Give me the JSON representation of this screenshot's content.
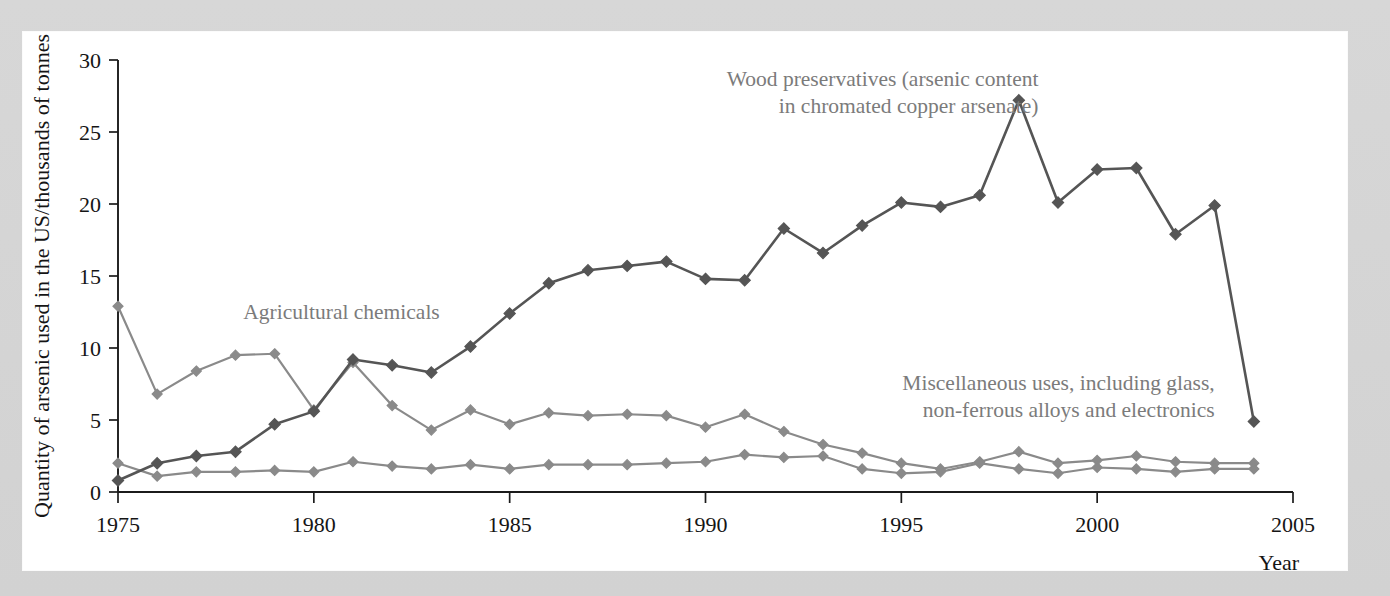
{
  "figure": {
    "background_color": "#d7d7d7",
    "panel_color": "#ffffff"
  },
  "chart_data": {
    "type": "line",
    "title": "",
    "subtitle": "",
    "xlabel": "Year",
    "ylabel": "Quantity of arsenic used in the US/thousands of tonnes",
    "xlim": [
      1975,
      2005
    ],
    "ylim": [
      0,
      30
    ],
    "xticks": [
      1975,
      1980,
      1985,
      1990,
      1995,
      2000,
      2005
    ],
    "xticklabels": [
      "1975",
      "1980",
      "1985",
      "1990",
      "1995",
      "2000",
      "2005"
    ],
    "yticks": [
      0,
      5,
      10,
      15,
      20,
      25,
      30
    ],
    "yticklabels": [
      "0",
      "5",
      "10",
      "15",
      "20",
      "25",
      "30"
    ],
    "grid": false,
    "legend": "annotations-inline",
    "marker": "diamond",
    "x": [
      1975,
      1976,
      1977,
      1978,
      1979,
      1980,
      1981,
      1982,
      1983,
      1984,
      1985,
      1986,
      1987,
      1988,
      1989,
      1990,
      1991,
      1992,
      1993,
      1994,
      1995,
      1996,
      1997,
      1998,
      1999,
      2000,
      2001,
      2002,
      2003,
      2004
    ],
    "series": [
      {
        "name": "Wood preservatives (arsenic content in chromated copper arsenate)",
        "color": "#555555",
        "values": [
          0.8,
          2.0,
          2.5,
          2.8,
          4.7,
          5.6,
          9.2,
          8.8,
          8.3,
          10.1,
          12.4,
          14.5,
          15.4,
          15.7,
          16.0,
          14.8,
          14.7,
          18.3,
          16.6,
          18.5,
          20.1,
          19.8,
          20.6,
          27.2,
          20.1,
          22.4,
          22.5,
          17.9,
          19.9,
          4.9
        ]
      },
      {
        "name": "Agricultural chemicals",
        "color": "#8a8a8a",
        "values": [
          12.9,
          6.8,
          8.4,
          9.5,
          9.6,
          5.7,
          9.0,
          6.0,
          4.3,
          5.7,
          4.7,
          5.5,
          5.3,
          5.4,
          5.3,
          4.5,
          5.4,
          4.2,
          3.3,
          2.7,
          2.0,
          1.6,
          2.1,
          2.8,
          2.0,
          2.2,
          2.5,
          2.1,
          2.0,
          2.0
        ]
      },
      {
        "name": "Miscellaneous uses, including glass, non-ferrous alloys and electronics",
        "color": "#8a8a8a",
        "values": [
          2.0,
          1.1,
          1.4,
          1.4,
          1.5,
          1.4,
          2.1,
          1.8,
          1.6,
          1.9,
          1.6,
          1.9,
          1.9,
          1.9,
          2.0,
          2.1,
          2.6,
          2.4,
          2.5,
          1.6,
          1.3,
          1.4,
          2.0,
          1.6,
          1.3,
          1.7,
          1.6,
          1.4,
          1.6,
          1.6
        ]
      }
    ],
    "annotations": [
      {
        "name": "annotation-agricultural-chemicals",
        "lines": [
          "Agricultural chemicals"
        ],
        "align": "left",
        "x": 1978.2,
        "y": 12.0
      },
      {
        "name": "annotation-wood-preservatives",
        "lines": [
          "Wood preservatives (arsenic content",
          "in chromated copper arsenate)"
        ],
        "align": "right",
        "x": 1998.5,
        "y": 28.2
      },
      {
        "name": "annotation-miscellaneous-uses",
        "lines": [
          "Miscellaneous uses, including glass,",
          "non-ferrous alloys and electronics"
        ],
        "align": "right",
        "x": 2003.0,
        "y": 7.1
      }
    ]
  }
}
